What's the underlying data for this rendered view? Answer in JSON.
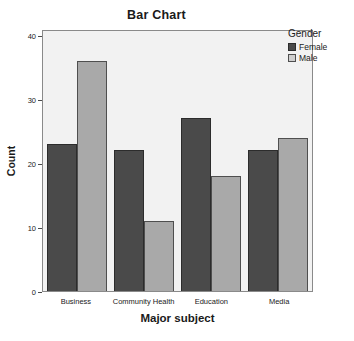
{
  "chart_data": {
    "type": "bar",
    "title": "Bar Chart",
    "xlabel": "Major subject",
    "ylabel": "Count",
    "categories": [
      "Business",
      "Community Health",
      "Education",
      "Media"
    ],
    "series": [
      {
        "name": "Female",
        "color": "#4a4a4a",
        "values": [
          23,
          36,
          22,
          11
        ]
      },
      {
        "name": "Male",
        "color": "#a9a9a9",
        "values": [
          23,
          36,
          22,
          11
        ]
      }
    ],
    "grouped_values": {
      "Business": {
        "Female": 23,
        "Male": 36
      },
      "Community Health": {
        "Female": 22,
        "Male": 11
      },
      "Education": {
        "Female": 27,
        "Male": 18
      },
      "Media": {
        "Female": 22,
        "Male": 24
      }
    },
    "ylim": [
      0,
      41
    ],
    "yticks": [
      0,
      10,
      20,
      30,
      40
    ],
    "ytick_labels": [
      "0",
      "10",
      "20",
      "30",
      "40"
    ],
    "grid": false,
    "legend": {
      "title": "Gender",
      "position": "top-right-outside",
      "entries": [
        {
          "label": "Female",
          "color": "#4a4a4a"
        },
        {
          "label": "Male",
          "color": "#cfcfcf"
        }
      ]
    }
  },
  "colors": {
    "plot_background": "#f2f2f2",
    "frame": "#8a8a8a",
    "female": "#4a4a4a",
    "male": "#a9a9a9",
    "text": "#1a1a1a"
  }
}
